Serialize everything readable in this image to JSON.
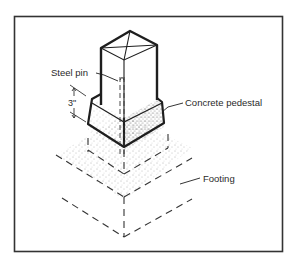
{
  "figure": {
    "type": "isometric technical illustration",
    "colors": {
      "ink": "#1e1e1e",
      "frame": "#333333",
      "stipple": "#555555",
      "background": "#ffffff"
    }
  },
  "labels": {
    "steel_pin": "Steel pin",
    "concrete_pedestal": "Concrete pedestal",
    "footing": "Footing",
    "dimension": "3\""
  }
}
